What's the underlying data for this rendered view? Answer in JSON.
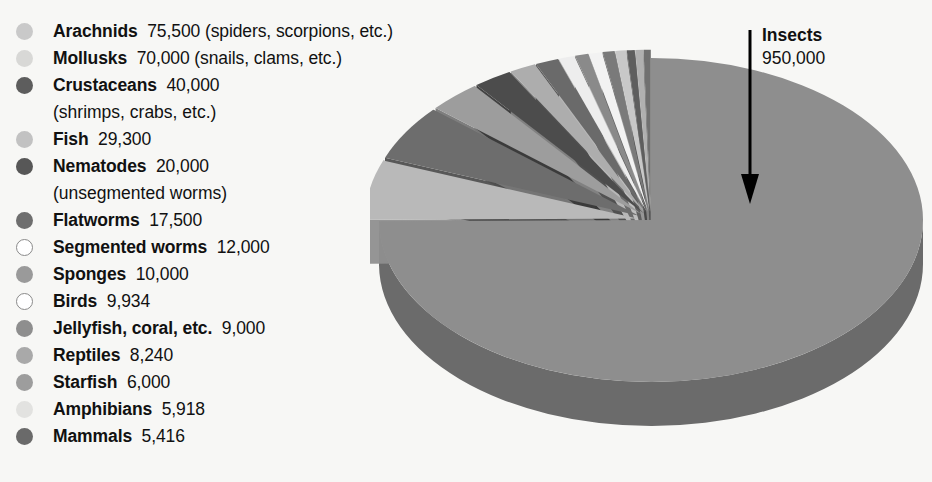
{
  "chart_data": {
    "type": "pie",
    "title": "",
    "units": "number of known species",
    "callout": {
      "label": "Insects",
      "value": "950,000",
      "value_number": 950000
    },
    "categories": [
      "Insects",
      "Arachnids",
      "Mollusks",
      "Crustaceans",
      "Fish",
      "Nematodes",
      "Flatworms",
      "Segmented worms",
      "Sponges",
      "Birds",
      "Jellyfish, coral, etc.",
      "Reptiles",
      "Starfish",
      "Amphibians",
      "Mammals"
    ],
    "values": [
      950000,
      75500,
      70000,
      40000,
      29300,
      20000,
      17500,
      12000,
      10000,
      9934,
      9000,
      8240,
      6000,
      5918,
      5416
    ],
    "legend_position": "left",
    "grid": false,
    "exploded": true,
    "three_d": true
  },
  "legend": {
    "items": [
      {
        "bullet": "light-gray-filled",
        "color": "#c9c9c9",
        "name": "Arachnids",
        "value": "75,500",
        "note": "(spiders, scorpions, etc.)",
        "cont": ""
      },
      {
        "bullet": "pale-gray-filled",
        "color": "#d8d8d6",
        "name": "Mollusks",
        "value": "70,000",
        "note": "(snails, clams, etc.)",
        "cont": ""
      },
      {
        "bullet": "dark-gray-filled",
        "color": "#5d5d5d",
        "name": "Crustaceans",
        "value": "40,000",
        "note": "",
        "cont": "(shrimps, crabs, etc.)"
      },
      {
        "bullet": "light-gray-filled",
        "color": "#c2c2c2",
        "name": "Fish",
        "value": "29,300",
        "note": "",
        "cont": ""
      },
      {
        "bullet": "dark-gray-filled",
        "color": "#575757",
        "name": "Nematodes",
        "value": "20,000",
        "note": "",
        "cont": "(unsegmented worms)"
      },
      {
        "bullet": "mid-gray-filled",
        "color": "#6e6e6e",
        "name": "Flatworms",
        "value": "17,500",
        "note": "",
        "cont": ""
      },
      {
        "bullet": "open-circle",
        "color": "#ffffff",
        "name": "Segmented worms",
        "value": "12,000",
        "note": "",
        "cont": ""
      },
      {
        "bullet": "mid-gray-filled",
        "color": "#9a9a9a",
        "name": "Sponges",
        "value": "10,000",
        "note": "",
        "cont": ""
      },
      {
        "bullet": "open-circle",
        "color": "#ffffff",
        "name": "Birds",
        "value": "9,934",
        "note": "",
        "cont": ""
      },
      {
        "bullet": "mid-gray-filled",
        "color": "#8e8e8e",
        "name": "Jellyfish, coral, etc.",
        "value": "9,000",
        "note": "",
        "cont": ""
      },
      {
        "bullet": "light-gray-filled",
        "color": "#a9a9a9",
        "name": "Reptiles",
        "value": "8,240",
        "note": "",
        "cont": ""
      },
      {
        "bullet": "mid-gray-filled",
        "color": "#9d9d9d",
        "name": "Starfish",
        "value": "6,000",
        "note": "",
        "cont": ""
      },
      {
        "bullet": "very-pale-filled",
        "color": "#e2e2e0",
        "name": "Amphibians",
        "value": "5,918",
        "note": "",
        "cont": ""
      },
      {
        "bullet": "dark-gray-filled",
        "color": "#6a6a6a",
        "name": "Mammals",
        "value": "5,416",
        "note": "",
        "cont": ""
      }
    ]
  },
  "colors": {
    "background": "#f7f7f5",
    "text": "#111111",
    "pie_main_top": "#8e8e8e",
    "pie_main_side": "#6b6b6b",
    "arrow": "#000000"
  },
  "pie_slices": [
    {
      "name": "Insects",
      "top": "#8e8e8e",
      "side": "#6b6b6b"
    },
    {
      "name": "Arachnids",
      "top": "#b9b9b9",
      "side": "#8f8f8f"
    },
    {
      "name": "Mollusks",
      "top": "#6d6d6d",
      "side": "#4f4f4f"
    },
    {
      "name": "Crustaceans",
      "top": "#9d9d9d",
      "side": "#777777"
    },
    {
      "name": "Fish",
      "top": "#4c4c4c",
      "side": "#383838"
    },
    {
      "name": "Nematodes",
      "top": "#adadad",
      "side": "#858585"
    },
    {
      "name": "Flatworms",
      "top": "#6a6a6a",
      "side": "#4e4e4e"
    },
    {
      "name": "Segmented worms",
      "top": "#ededed",
      "side": "#bdbdbd"
    },
    {
      "name": "Sponges",
      "top": "#8a8a8a",
      "side": "#676767"
    },
    {
      "name": "Birds",
      "top": "#f2f2f2",
      "side": "#c4c4c4"
    },
    {
      "name": "Jellyfish, coral, etc.",
      "top": "#7a7a7a",
      "side": "#5b5b5b"
    },
    {
      "name": "Reptiles",
      "top": "#c8c8c8",
      "side": "#9a9a9a"
    },
    {
      "name": "Starfish",
      "top": "#5e5e5e",
      "side": "#454545"
    },
    {
      "name": "Amphibians",
      "top": "#b0b0b0",
      "side": "#888888"
    },
    {
      "name": "Mammals",
      "top": "#707070",
      "side": "#535353"
    }
  ]
}
